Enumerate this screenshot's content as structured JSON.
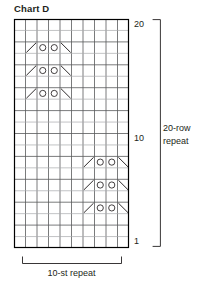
{
  "title": "Chart D",
  "colors": {
    "ink": "#231f20",
    "grid_line": "#58595b",
    "grid_line_light": "#a7a9ac",
    "border": "#000000",
    "symbol": "#231f20"
  },
  "grid": {
    "columns": 10,
    "rows": 20,
    "cell_width": 11.5,
    "cell_height": 11.45
  },
  "row_labels": [
    {
      "text": "20",
      "row": 20
    },
    {
      "text": "10",
      "row": 10
    },
    {
      "text": "1",
      "row": 1
    }
  ],
  "legend_symbols": [
    {
      "name": "yarn-over",
      "glyph": "o"
    },
    {
      "name": "left-leaning-decrease",
      "glyph": "\\"
    },
    {
      "name": "right-leaning-decrease",
      "glyph": "/"
    }
  ],
  "chart_data": {
    "type": "heatmap",
    "title": "Chart D",
    "xlabel": "10-st repeat",
    "ylabel": "20-row repeat",
    "columns": 10,
    "rows": 20,
    "grid": true,
    "legend_position": "none",
    "symbols": [
      {
        "row": 18,
        "col": 6,
        "type": "left-leaning-decrease",
        "glyph": "\\"
      },
      {
        "row": 18,
        "col": 7,
        "type": "yarn-over",
        "glyph": "o"
      },
      {
        "row": 18,
        "col": 8,
        "type": "yarn-over",
        "glyph": "o"
      },
      {
        "row": 18,
        "col": 9,
        "type": "right-leaning-decrease",
        "glyph": "/"
      },
      {
        "row": 16,
        "col": 6,
        "type": "left-leaning-decrease",
        "glyph": "\\"
      },
      {
        "row": 16,
        "col": 7,
        "type": "yarn-over",
        "glyph": "o"
      },
      {
        "row": 16,
        "col": 8,
        "type": "yarn-over",
        "glyph": "o"
      },
      {
        "row": 16,
        "col": 9,
        "type": "right-leaning-decrease",
        "glyph": "/"
      },
      {
        "row": 14,
        "col": 6,
        "type": "left-leaning-decrease",
        "glyph": "\\"
      },
      {
        "row": 14,
        "col": 7,
        "type": "yarn-over",
        "glyph": "o"
      },
      {
        "row": 14,
        "col": 8,
        "type": "yarn-over",
        "glyph": "o"
      },
      {
        "row": 14,
        "col": 9,
        "type": "right-leaning-decrease",
        "glyph": "/"
      },
      {
        "row": 8,
        "col": 1,
        "type": "left-leaning-decrease",
        "glyph": "\\"
      },
      {
        "row": 8,
        "col": 2,
        "type": "yarn-over",
        "glyph": "o"
      },
      {
        "row": 8,
        "col": 3,
        "type": "yarn-over",
        "glyph": "o"
      },
      {
        "row": 8,
        "col": 4,
        "type": "right-leaning-decrease",
        "glyph": "/"
      },
      {
        "row": 6,
        "col": 1,
        "type": "left-leaning-decrease",
        "glyph": "\\"
      },
      {
        "row": 6,
        "col": 2,
        "type": "yarn-over",
        "glyph": "o"
      },
      {
        "row": 6,
        "col": 3,
        "type": "yarn-over",
        "glyph": "o"
      },
      {
        "row": 6,
        "col": 4,
        "type": "right-leaning-decrease",
        "glyph": "/"
      },
      {
        "row": 4,
        "col": 1,
        "type": "left-leaning-decrease",
        "glyph": "\\"
      },
      {
        "row": 4,
        "col": 2,
        "type": "yarn-over",
        "glyph": "o"
      },
      {
        "row": 4,
        "col": 3,
        "type": "yarn-over",
        "glyph": "o"
      },
      {
        "row": 4,
        "col": 4,
        "type": "right-leaning-decrease",
        "glyph": "/"
      }
    ]
  },
  "row_repeat": {
    "line1": "20-row",
    "line2": "repeat"
  },
  "st_repeat": {
    "label": "10-st repeat"
  }
}
